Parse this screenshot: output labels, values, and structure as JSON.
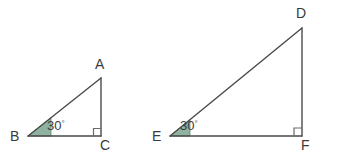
{
  "figure": {
    "background_color": "#ffffff",
    "stroke_color": "#4a4a4a",
    "label_color": "#3b3b3b",
    "angle_fill_color": "#8fb3a0",
    "angle_fill_stroke": "#5f8a72",
    "right_angle_color": "#6b6b6b",
    "triangles": [
      {
        "name": "triangle-abc",
        "vertices": [
          {
            "id": "A",
            "label": "A",
            "x": 101,
            "y": 78
          },
          {
            "id": "B",
            "label": "B",
            "x": 28,
            "y": 136
          },
          {
            "id": "C",
            "label": "C",
            "x": 101,
            "y": 136
          }
        ],
        "angle_marker": {
          "at": "B",
          "value": "30",
          "degree_symbol": "°"
        },
        "right_angle": {
          "at": "C"
        }
      },
      {
        "name": "triangle-def",
        "vertices": [
          {
            "id": "D",
            "label": "D",
            "x": 302,
            "y": 28
          },
          {
            "id": "E",
            "label": "E",
            "x": 170,
            "y": 136
          },
          {
            "id": "F",
            "label": "F",
            "x": 302,
            "y": 136
          }
        ],
        "angle_marker": {
          "at": "E",
          "value": "30",
          "degree_symbol": "°"
        },
        "right_angle": {
          "at": "F"
        }
      }
    ],
    "labels": {
      "a": "A",
      "b": "B",
      "c": "C",
      "d": "D",
      "e": "E",
      "f": "F",
      "angle_abc": "30",
      "angle_def": "30",
      "degree_symbol": "°"
    }
  }
}
